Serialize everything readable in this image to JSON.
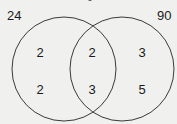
{
  "labels": {
    "left_set": "24",
    "right_set": "90"
  },
  "regions": {
    "left_only": [
      "2",
      "2"
    ],
    "intersection": [
      "2",
      "3"
    ],
    "right_only": [
      "3",
      "5"
    ]
  },
  "colors": {
    "stroke": "#3a3a3a",
    "background": "#f0f0ee"
  }
}
